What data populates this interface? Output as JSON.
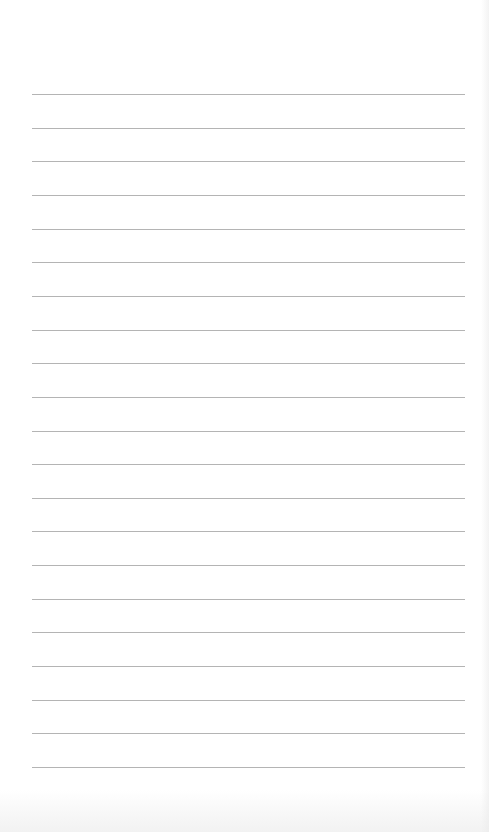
{
  "page": {
    "type": "lined-paper",
    "background_color": "#ffffff",
    "rule_color": "#b4b4b4",
    "rule_count": 21,
    "rule_left_px": 32,
    "rule_right_px": 465,
    "first_rule_y_px": 94,
    "rule_spacing_px": 33.65
  }
}
